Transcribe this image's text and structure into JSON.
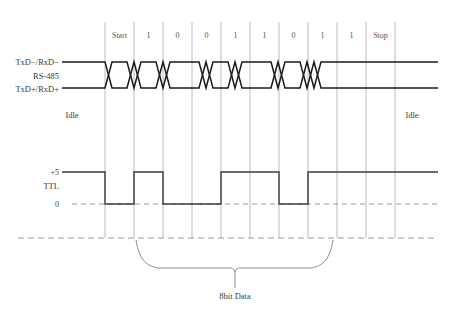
{
  "diagram": {
    "caption": "8bit Data",
    "signals": {
      "diff_top_label": "TxD−/RxD−",
      "diff_name_label": "RS-485",
      "diff_bottom_label": "TxD+/RxD+",
      "ttl_label": "TTL",
      "ttl_high_label": "+5",
      "ttl_low_label": "0",
      "idle_left_label": "Idle",
      "idle_right_label": "Idle"
    },
    "bits": [
      {
        "label": "Start",
        "value": 0
      },
      {
        "label": "1",
        "value": 1
      },
      {
        "label": "0",
        "value": 0
      },
      {
        "label": "0",
        "value": 0
      },
      {
        "label": "1",
        "value": 1
      },
      {
        "label": "1",
        "value": 1
      },
      {
        "label": "0",
        "value": 0
      },
      {
        "label": "1",
        "value": 1
      },
      {
        "label": "1",
        "value": 1
      },
      {
        "label": "Stop",
        "value": 1
      }
    ],
    "data_bit_sequence": "1 0 0 1 1 0 1 1",
    "colors": {
      "background": "#ffffff",
      "gridline": "#a9a9a9",
      "differential_wave": "#1a1a1a",
      "ttl_wave": "#3c3c3c",
      "dashed_reference": "#9a9a9a",
      "text": "#3a3a3a",
      "brace": "#8c8c8c"
    },
    "geometry": {
      "grid_x_start": 105,
      "grid_x_end": 395,
      "grid_y_top": 22,
      "grid_y_bottom": 238,
      "bit_width": 29,
      "diff_high_y": 62,
      "diff_low_y": 88,
      "ttl_high_y": 172,
      "ttl_low_y": 204,
      "wave_x_left": 62,
      "wave_x_right": 438,
      "brace_x_left": 136,
      "brace_x_right": 333,
      "brace_stem_x": 235
    }
  }
}
